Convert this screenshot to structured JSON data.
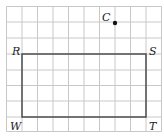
{
  "diagram": {
    "type": "grid-figure",
    "grid": {
      "columns": 10,
      "rows": 8,
      "line_color": "#c8c8c8"
    },
    "rectangle": {
      "vertices": [
        {
          "label": "R",
          "col": 1,
          "row": 3
        },
        {
          "label": "S",
          "col": 9,
          "row": 3
        },
        {
          "label": "T",
          "col": 9,
          "row": 7
        },
        {
          "label": "W",
          "col": 1,
          "row": 7
        }
      ],
      "stroke_color": "#444444"
    },
    "point": {
      "label": "C",
      "col": 7,
      "row": 1,
      "color": "#111111"
    }
  }
}
